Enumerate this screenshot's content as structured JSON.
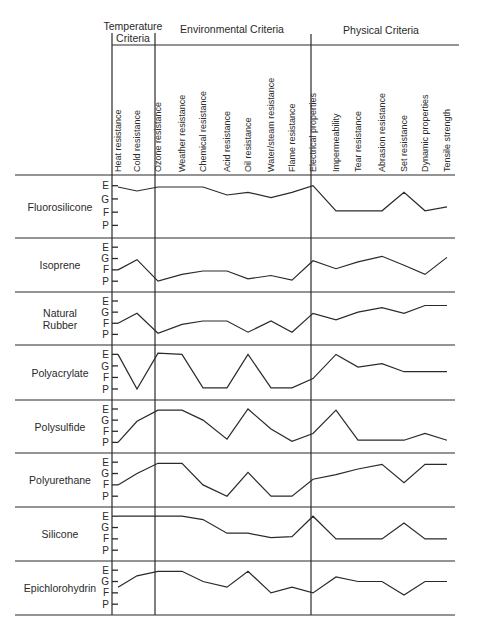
{
  "chart_data": {
    "type": "line",
    "title": "",
    "group_headers": [
      {
        "label_lines": [
          "Temperature",
          "Criteria"
        ],
        "columns": [
          "Heat resistance",
          "Cold resistance"
        ]
      },
      {
        "label_lines": [
          "Environmental Criteria"
        ],
        "columns": [
          "Ozone resistance",
          "Weather resistance",
          "Chemical resistance",
          "Acid resistance",
          "Oil resistance",
          "Water/steam resistance",
          "Flame resistance"
        ]
      },
      {
        "label_lines": [
          "Physical Criteria"
        ],
        "columns": [
          "Electrical properties",
          "Impermeability",
          "Tear resistance",
          "Abrasion resistance",
          "Set resistance",
          "Dynamic properties",
          "Tensile strength"
        ]
      }
    ],
    "categories": [
      "Heat resistance",
      "Cold resistance",
      "Ozone resistance",
      "Weather resistance",
      "Chemical resistance",
      "Acid resistance",
      "Oil resistance",
      "Water/steam resistance",
      "Flame resistance",
      "Electrical properties",
      "Impermeability",
      "Tear resistance",
      "Abrasion resistance",
      "Set resistance",
      "Dynamic properties",
      "Tensile strength"
    ],
    "rating_scale": [
      "E",
      "G",
      "F",
      "P"
    ],
    "rating_values": {
      "E": 4,
      "G": 3,
      "F": 2,
      "P": 1
    },
    "ylim": [
      1,
      4
    ],
    "series": [
      {
        "name": "Fluorosilicone",
        "values": [
          3.9,
          3.6,
          3.9,
          3.9,
          3.9,
          3.3,
          3.5,
          3.1,
          3.5,
          4.0,
          2.1,
          2.1,
          2.1,
          3.5,
          2.1,
          2.4
        ]
      },
      {
        "name": "Isoprene",
        "values": [
          2.0,
          2.9,
          1.0,
          1.6,
          1.9,
          1.9,
          1.2,
          1.5,
          1.1,
          2.8,
          2.1,
          2.7,
          3.2,
          2.4,
          1.6,
          3.1
        ]
      },
      {
        "name": "Natural Rubber",
        "values": [
          2.0,
          2.9,
          1.1,
          1.9,
          2.2,
          2.2,
          1.2,
          2.2,
          1.2,
          2.9,
          2.3,
          3.0,
          3.4,
          2.9,
          3.6,
          3.6
        ]
      },
      {
        "name": "Polyacrylate",
        "values": [
          4.0,
          1.0,
          4.1,
          4.0,
          1.1,
          1.1,
          4.0,
          1.1,
          1.1,
          1.9,
          4.0,
          2.9,
          3.2,
          2.5,
          2.5,
          2.5
        ]
      },
      {
        "name": "Polysulfide",
        "values": [
          1.0,
          2.9,
          3.9,
          3.9,
          3.0,
          1.3,
          4.0,
          2.2,
          1.1,
          1.8,
          3.9,
          1.2,
          1.2,
          1.2,
          1.8,
          1.2
        ]
      },
      {
        "name": "Polyurethane",
        "values": [
          2.0,
          3.0,
          3.9,
          3.9,
          2.0,
          1.0,
          3.1,
          1.0,
          1.0,
          2.5,
          2.9,
          3.4,
          3.8,
          2.2,
          3.8,
          3.8
        ]
      },
      {
        "name": "Silicone",
        "values": [
          4.0,
          4.0,
          4.0,
          4.0,
          3.7,
          2.5,
          2.5,
          2.1,
          2.2,
          4.0,
          2.0,
          2.0,
          2.0,
          3.4,
          2.0,
          2.0
        ]
      },
      {
        "name": "Epichlorohydrin",
        "values": [
          2.5,
          3.5,
          3.9,
          3.9,
          3.0,
          2.5,
          3.9,
          2.0,
          2.5,
          2.0,
          3.4,
          3.0,
          3.0,
          1.8,
          3.0,
          3.0
        ]
      }
    ]
  },
  "layout": {
    "plot_left": 112,
    "temp_divider_x": 155,
    "phys_divider_x": 311,
    "plot_right": 455,
    "label_right": 112,
    "column_x": [
      118,
      137,
      158,
      182,
      203,
      227,
      248,
      271,
      292,
      313,
      336,
      358,
      382,
      404,
      425,
      447
    ],
    "row_tops": [
      175,
      238,
      292,
      345,
      400,
      453,
      507,
      561
    ],
    "row_bottom": 615,
    "line_color": "#2a2a2a"
  }
}
